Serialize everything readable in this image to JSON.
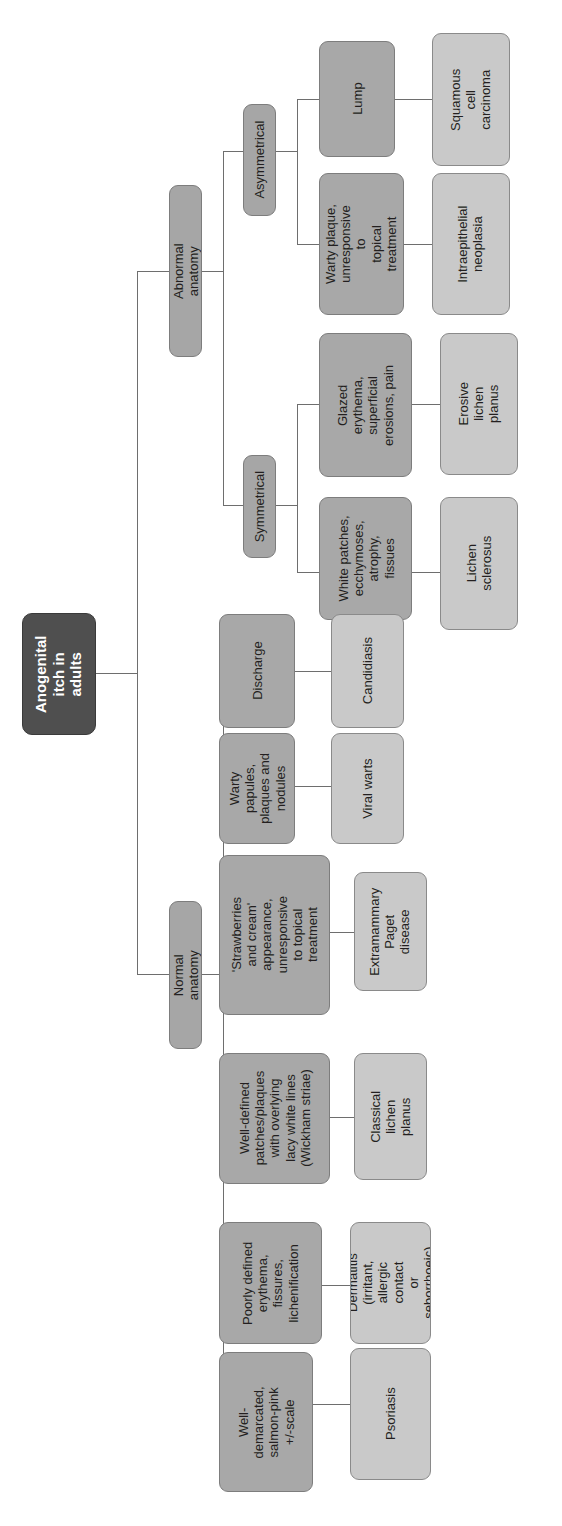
{
  "diagram": {
    "title": "Anogenital itch in adults",
    "type": "flowchart-tree",
    "orientation": "rotated-90-left",
    "colors": {
      "root_fill": "#4f4f4f",
      "root_text": "#ffffff",
      "branch_fill": "#a6a6a6",
      "leaf_fill": "#c9c9c9",
      "border": "#7d7d7d",
      "connector": "#6e6e6e",
      "background": "#ffffff"
    },
    "root": {
      "label": "Anogenital\nitch in\nadults"
    },
    "branches": [
      {
        "id": "normal",
        "label": "Normal anatomy"
      },
      {
        "id": "abnormal",
        "label": "Abnormal anatomy"
      }
    ],
    "abnormal_subbranches": [
      {
        "id": "symmetrical",
        "label": "Symmetrical"
      },
      {
        "id": "asymmetrical",
        "label": "Asymmetrical"
      }
    ],
    "features": [
      {
        "id": "f-well-demarcated",
        "label": "Well-demarcated,\nsalmon-pink\n+/-scale"
      },
      {
        "id": "f-poorly-defined",
        "label": "Poorly defined\nerythema,\nfissures,\nlichenification"
      },
      {
        "id": "f-wickham",
        "label": "Well-defined\npatches/plaques\nwith overlying\nlacy white lines\n(Wickham striae)"
      },
      {
        "id": "f-strawberries",
        "label": "'Strawberries\nand cream'\nappearance,\nunresponsive\nto topical\ntreatment"
      },
      {
        "id": "f-warty-papules",
        "label": "Warty papules,\nplaques and\nnodules"
      },
      {
        "id": "f-discharge",
        "label": "Discharge"
      },
      {
        "id": "f-white-patches",
        "label": "White patches,\necchymoses,\natrophy,\nfissues"
      },
      {
        "id": "f-glazed",
        "label": "Glazed erythema,\nsuperficial\nerosions, pain"
      },
      {
        "id": "f-warty-plaque",
        "label": "Warty plaque,\nunresponsive to\ntopical treatment"
      },
      {
        "id": "f-lump",
        "label": "Lump"
      }
    ],
    "diagnoses": [
      {
        "id": "d-psoriasis",
        "label": "Psoriasis"
      },
      {
        "id": "d-dermatitis",
        "label": "Dermatitis\n(irritant,\nallergic contact\nor seborrhoeic)"
      },
      {
        "id": "d-lichen-planus",
        "label": "Classical lichen\nplanus"
      },
      {
        "id": "d-paget",
        "label": "Extramammary\nPaget\ndisease"
      },
      {
        "id": "d-viral-warts",
        "label": "Viral warts"
      },
      {
        "id": "d-candidiasis",
        "label": "Candidiasis"
      },
      {
        "id": "d-lichen-scl",
        "label": "Lichen\nsclerosus"
      },
      {
        "id": "d-erosive-lp",
        "label": "Erosive lichen\nplanus"
      },
      {
        "id": "d-vin",
        "label": "Intraepithelial\nneoplasia"
      },
      {
        "id": "d-scc",
        "label": "Squamous cell\ncarcinoma"
      }
    ]
  }
}
